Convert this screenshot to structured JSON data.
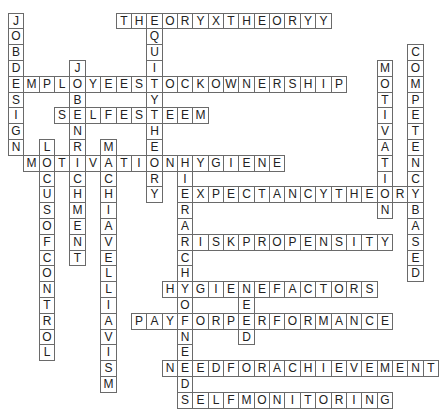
{
  "puzzle": {
    "type": "crossword-solution",
    "grid": {
      "origin_x": 8,
      "origin_y": 12.5,
      "cell_w": 15.36,
      "cell_h": 15.8,
      "cols": 28,
      "rows": 25
    },
    "colors": {
      "border": "#6a6a6a",
      "text": "#222222",
      "background": "#ffffff"
    },
    "words": [
      {
        "word": "THEORYXTHEORYY",
        "dir": "across",
        "row": 0,
        "col": 7
      },
      {
        "word": "JOBDESIGN",
        "dir": "down",
        "row": 0,
        "col": 0
      },
      {
        "word": "EQUITYTHEORY",
        "dir": "down",
        "row": 0,
        "col": 9
      },
      {
        "word": "COMPETENCYBASED",
        "dir": "down",
        "row": 2,
        "col": 26
      },
      {
        "word": "JOBENRICHMENT",
        "dir": "down",
        "row": 3,
        "col": 4
      },
      {
        "word": "MOTIVATION",
        "dir": "down",
        "row": 3,
        "col": 24
      },
      {
        "word": "EMPLOYEESTOCKOWNERSHIP",
        "dir": "across",
        "row": 4,
        "col": 0
      },
      {
        "word": "SELFESTEEM",
        "dir": "across",
        "row": 6,
        "col": 3
      },
      {
        "word": "LOCUSOFCONTROL",
        "dir": "down",
        "row": 8,
        "col": 2
      },
      {
        "word": "MACHIAVELLIAVISM",
        "dir": "down",
        "row": 8,
        "col": 6
      },
      {
        "word": "MOTIVATIONHYGIENE",
        "dir": "across",
        "row": 9,
        "col": 1
      },
      {
        "word": "HIERARCHYOFNEEDS",
        "dir": "down",
        "row": 9,
        "col": 11
      },
      {
        "word": "EXPECTANCYTHEORY",
        "dir": "across",
        "row": 11,
        "col": 11
      },
      {
        "word": "RISKPROPENSITY",
        "dir": "across",
        "row": 14,
        "col": 11
      },
      {
        "word": "HYGIENEFACTORS",
        "dir": "across",
        "row": 17,
        "col": 10
      },
      {
        "word": "NEED",
        "dir": "down",
        "row": 17,
        "col": 15
      },
      {
        "word": "PAYFORPERFORMANCE",
        "dir": "across",
        "row": 19,
        "col": 8
      },
      {
        "word": "NEEDFORACHIEVEMENT",
        "dir": "across",
        "row": 22,
        "col": 10
      },
      {
        "word": "SELFMONITORING",
        "dir": "across",
        "row": 24,
        "col": 11
      }
    ]
  }
}
